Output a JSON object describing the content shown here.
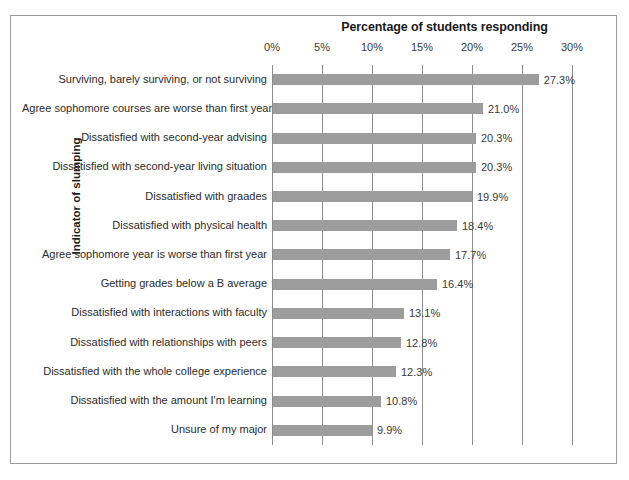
{
  "chart_data": {
    "type": "bar",
    "orientation": "horizontal",
    "title": "Percentage of students responding",
    "xlabel": "",
    "ylabel": "Indicator of slumping",
    "xlim": [
      0,
      30
    ],
    "grid": true,
    "legend": null,
    "bar_color": "#9d9d9d",
    "xticks": [
      "0%",
      "5%",
      "10%",
      "15%",
      "20%",
      "25%",
      "30%"
    ],
    "xtick_values": [
      0,
      5,
      10,
      15,
      20,
      25,
      30
    ],
    "categories": [
      "Surviving, barely surviving, or not surviving",
      "Agree sophomore courses are worse than first year",
      "Dissatisfied with second-year advising",
      "Dissatisfied with second-year living situation",
      "Dissatisfied with graades",
      "Dissatisfied with physical health",
      "Agree sophomore year is worse than first year",
      "Getting grades below a B average",
      "Dissatisfied with interactions with faculty",
      "Dissatisfied with relationships with peers",
      "Dissatisfied with the whole college experience",
      "Dissatisfied with the amount I'm learning",
      "Unsure of my major"
    ],
    "values": [
      27.3,
      21.0,
      20.3,
      20.3,
      19.9,
      18.4,
      17.7,
      16.4,
      13.1,
      12.8,
      12.3,
      10.8,
      9.9
    ],
    "value_labels": [
      "27.3%",
      "21.0%",
      "20.3%",
      "20.3%",
      "19.9%",
      "18.4%",
      "17.7%",
      "16.4%",
      "13.1%",
      "12.8%",
      "12.3%",
      "10.8%",
      "9.9%"
    ]
  },
  "figure": {
    "border_color": "#9a9a9a",
    "background": "#ffffff"
  }
}
